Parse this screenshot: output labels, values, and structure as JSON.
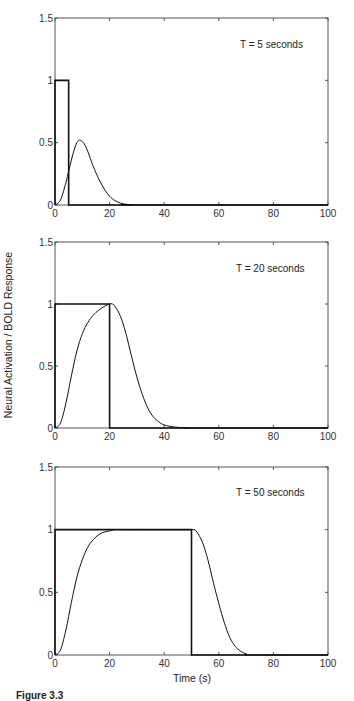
{
  "figure": {
    "ylabel": "Neural Activation / BOLD Response",
    "xlabel": "Time (s)",
    "caption": "Figure 3.3"
  },
  "chart_data": [
    {
      "type": "line",
      "title": "T = 5 seconds",
      "xlabel": "",
      "ylabel": "Neural Activation / BOLD Response",
      "xlim": [
        0,
        100
      ],
      "ylim": [
        0,
        1.5
      ],
      "xticks": [
        0,
        20,
        40,
        60,
        80,
        100
      ],
      "yticks": [
        0,
        0.5,
        1,
        1.5
      ],
      "ytick_labels": [
        "0",
        "0.5",
        "1",
        "1.5"
      ],
      "grid": false,
      "series": [
        {
          "name": "Neural activation",
          "style": "step",
          "x": [
            0,
            0,
            5,
            5,
            100
          ],
          "y": [
            0,
            1,
            1,
            0,
            0
          ]
        },
        {
          "name": "BOLD response",
          "style": "smooth",
          "x": [
            0,
            2,
            4,
            5,
            6,
            7,
            8,
            9,
            10,
            11,
            12,
            13,
            14,
            16,
            18,
            20,
            22,
            24,
            26,
            28,
            30,
            100
          ],
          "y": [
            0,
            0.04,
            0.18,
            0.27,
            0.36,
            0.44,
            0.5,
            0.52,
            0.51,
            0.48,
            0.43,
            0.37,
            0.31,
            0.21,
            0.13,
            0.07,
            0.035,
            0.015,
            0.006,
            0.002,
            0,
            0
          ]
        }
      ]
    },
    {
      "type": "line",
      "title": "T = 20 seconds",
      "xlabel": "",
      "ylabel": "Neural Activation / BOLD Response",
      "xlim": [
        0,
        100
      ],
      "ylim": [
        0,
        1.5
      ],
      "xticks": [
        0,
        20,
        40,
        60,
        80,
        100
      ],
      "yticks": [
        0,
        0.5,
        1,
        1.5
      ],
      "ytick_labels": [
        "0",
        "0.5",
        "1",
        "1.5"
      ],
      "grid": false,
      "series": [
        {
          "name": "Neural activation",
          "style": "step",
          "x": [
            0,
            0,
            20,
            20,
            100
          ],
          "y": [
            0,
            1,
            1,
            0,
            0
          ]
        },
        {
          "name": "BOLD response",
          "style": "smooth",
          "x": [
            0,
            2,
            4,
            6,
            8,
            10,
            12,
            14,
            16,
            18,
            20,
            21,
            22,
            24,
            26,
            28,
            30,
            32,
            34,
            36,
            38,
            40,
            44,
            48,
            52,
            100
          ],
          "y": [
            0,
            0.04,
            0.2,
            0.42,
            0.62,
            0.76,
            0.85,
            0.91,
            0.95,
            0.98,
            1.0,
            1.0,
            0.98,
            0.9,
            0.76,
            0.58,
            0.41,
            0.27,
            0.16,
            0.09,
            0.05,
            0.025,
            0.007,
            0.002,
            0,
            0
          ]
        }
      ]
    },
    {
      "type": "line",
      "title": "T = 50 seconds",
      "xlabel": "Time (s)",
      "ylabel": "Neural Activation / BOLD Response",
      "xlim": [
        0,
        100
      ],
      "ylim": [
        0,
        1.5
      ],
      "xticks": [
        0,
        20,
        40,
        60,
        80,
        100
      ],
      "yticks": [
        0,
        0.5,
        1,
        1.5
      ],
      "ytick_labels": [
        "0",
        "0.5",
        "1",
        "1.5"
      ],
      "grid": false,
      "series": [
        {
          "name": "Neural activation",
          "style": "step",
          "x": [
            0,
            0,
            50,
            50,
            100
          ],
          "y": [
            0,
            1,
            1,
            0,
            0
          ]
        },
        {
          "name": "BOLD response",
          "style": "smooth",
          "x": [
            0,
            2,
            4,
            6,
            8,
            10,
            12,
            14,
            16,
            18,
            20,
            22,
            25,
            30,
            40,
            50,
            51,
            52,
            54,
            56,
            58,
            60,
            62,
            64,
            66,
            68,
            70,
            72,
            100
          ],
          "y": [
            0,
            0.04,
            0.2,
            0.42,
            0.62,
            0.76,
            0.86,
            0.92,
            0.96,
            0.98,
            0.99,
            1.0,
            1.0,
            1.0,
            1.0,
            1.0,
            1.0,
            0.98,
            0.9,
            0.76,
            0.58,
            0.41,
            0.26,
            0.14,
            0.07,
            0.03,
            0.01,
            0,
            0
          ]
        }
      ]
    }
  ]
}
